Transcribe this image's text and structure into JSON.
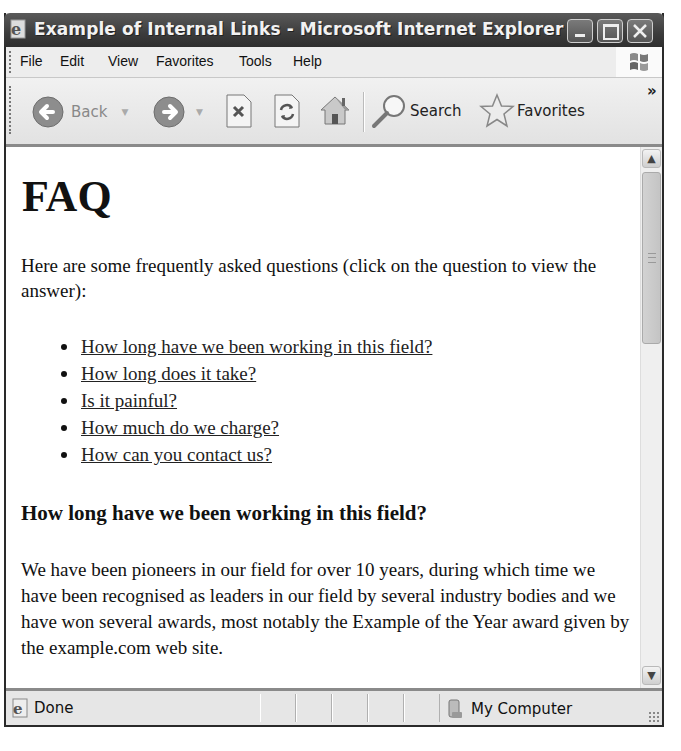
{
  "window": {
    "title": "Example of Internal Links - Microsoft Internet Explorer",
    "controls": [
      "minimize",
      "maximize",
      "close"
    ]
  },
  "menubar": {
    "items": [
      "File",
      "Edit",
      "View",
      "Favorites",
      "Tools",
      "Help"
    ]
  },
  "toolbar": {
    "back_label": "Back",
    "search_label": "Search",
    "favorites_label": "Favorites",
    "overflow_label": "»"
  },
  "page": {
    "heading": "FAQ",
    "intro": "Here are some frequently asked questions (click on the question to view the answer):",
    "questions": [
      "How long have we been working in this field?",
      "How long does it take?",
      "Is it painful?",
      "How much do we charge?",
      "How can you contact us?"
    ],
    "answer_heading": "How long have we been working in this field?",
    "answer_text": "We have been pioneers in our field for over 10 years, during which time we have been recognised as leaders in our field by several industry bodies and we have won several awards, most notably the Example of the Year award given by the example.com web site."
  },
  "statusbar": {
    "status": "Done",
    "zone": "My Computer"
  }
}
